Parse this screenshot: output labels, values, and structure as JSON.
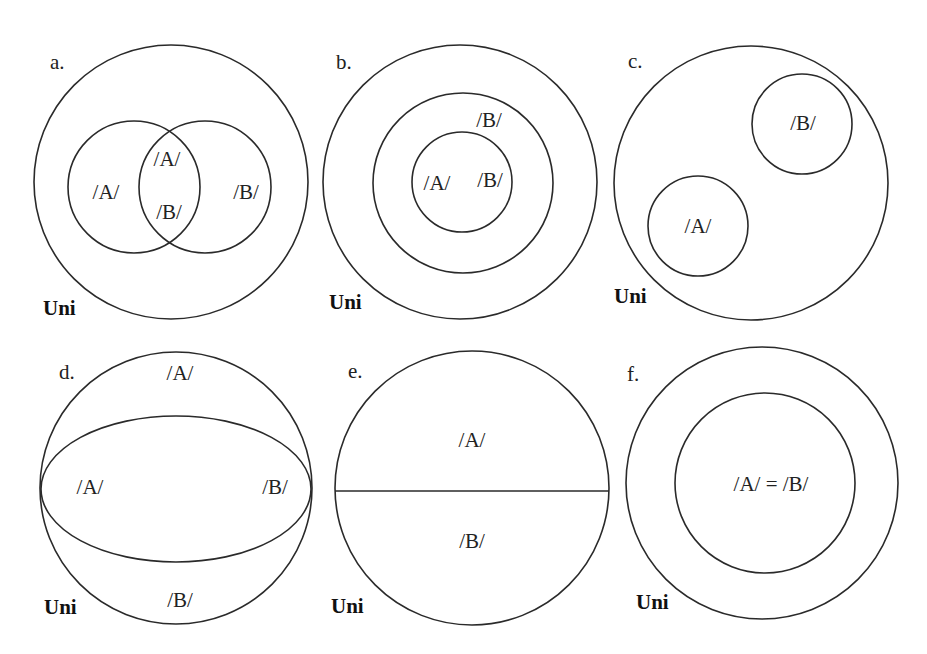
{
  "figure": {
    "panels": [
      {
        "id": "a",
        "letter": "a.",
        "universe_label": "Uni",
        "relation": "overlap",
        "labels": [
          "/A/",
          "/A/",
          "/B/",
          "/B/"
        ]
      },
      {
        "id": "b",
        "letter": "b.",
        "universe_label": "Uni",
        "relation": "A subset of B",
        "labels": [
          "/B/",
          "/A/",
          "/B/"
        ]
      },
      {
        "id": "c",
        "letter": "c.",
        "universe_label": "Uni",
        "relation": "disjoint",
        "labels": [
          "/B/",
          "/A/"
        ]
      },
      {
        "id": "d",
        "letter": "d.",
        "universe_label": "Uni",
        "relation": "union equals universe with overlap",
        "labels": [
          "/A/",
          "/A/",
          "/B/",
          "/B/"
        ]
      },
      {
        "id": "e",
        "letter": "e.",
        "universe_label": "Uni",
        "relation": "partition of universe",
        "labels": [
          "/A/",
          "/B/"
        ]
      },
      {
        "id": "f",
        "letter": "f.",
        "universe_label": "Uni",
        "relation": "identity",
        "labels": [
          "/A/ = /B/"
        ]
      }
    ],
    "stroke_color": "#2a2a2a",
    "background": "#ffffff"
  }
}
